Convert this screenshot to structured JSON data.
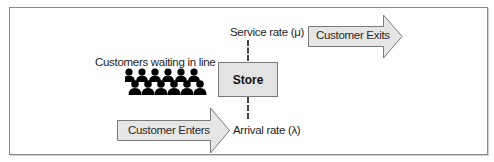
{
  "diagram": {
    "queue_label": "Customers waiting in line",
    "store_label": "Store",
    "service_rate_label": "Service rate (μ)",
    "arrival_rate_label": "Arrival rate (λ)",
    "exit_arrow_label": "Customer Exits",
    "enter_arrow_label": "Customer Enters",
    "people_count": 12,
    "icons": {
      "people": "people-group-icon",
      "exit_arrow": "arrow-right-icon",
      "enter_arrow": "arrow-right-icon"
    },
    "colors": {
      "box_fill": "#e3e3e3",
      "arrow_fill": "#e6e6e6",
      "stroke": "#7a7a7a",
      "people": "#000000",
      "text": "#1e1e1e"
    }
  }
}
